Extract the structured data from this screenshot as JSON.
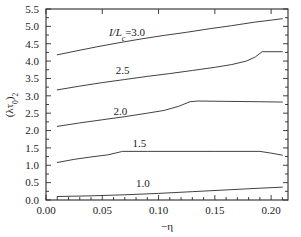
{
  "chart_data": {
    "type": "line",
    "title": "",
    "subtitle": "",
    "xlabel": "−η",
    "ylabel": "(λτ₀)₂",
    "xlim": [
      0.0,
      0.215
    ],
    "ylim": [
      0.0,
      5.5
    ],
    "xticks": [
      0.0,
      0.05,
      0.1,
      0.15,
      0.2
    ],
    "xtick_labels": [
      "0.00",
      "0.05",
      "0.10",
      "0.15",
      "0.20"
    ],
    "x_minor_tick_count": 4,
    "yticks": [
      0.0,
      0.5,
      1.0,
      1.5,
      2.0,
      2.5,
      3.0,
      3.5,
      4.0,
      4.5,
      5.0,
      5.5
    ],
    "ytick_labels": [
      "0.0",
      "0.5",
      "1.0",
      "1.5",
      "2.0",
      "2.5",
      "3.0",
      "3.5",
      "4.0",
      "4.5",
      "5.0",
      "5.5"
    ],
    "grid": false,
    "legend_position": "inline-annotations",
    "line_color": "#2b2b2b",
    "series": [
      {
        "name": "I/Lc=3.0",
        "annotation": "I/Lₑ=3.0",
        "annotation_x": 0.072,
        "annotation_y": 4.73,
        "x": [
          0.01,
          0.025,
          0.045,
          0.065,
          0.085,
          0.105,
          0.125,
          0.145,
          0.165,
          0.185,
          0.2,
          0.21
        ],
        "y": [
          4.18,
          4.28,
          4.41,
          4.53,
          4.64,
          4.74,
          4.83,
          4.93,
          5.02,
          5.12,
          5.18,
          5.22
        ]
      },
      {
        "name": "2.5",
        "annotation": "2.5",
        "annotation_x": 0.068,
        "annotation_y": 3.62,
        "x": [
          0.01,
          0.03,
          0.05,
          0.07,
          0.09,
          0.11,
          0.13,
          0.15,
          0.165,
          0.178,
          0.186,
          0.192,
          0.21
        ],
        "y": [
          3.17,
          3.28,
          3.38,
          3.47,
          3.56,
          3.64,
          3.73,
          3.82,
          3.9,
          4.0,
          4.12,
          4.27,
          4.27
        ]
      },
      {
        "name": "2.0",
        "annotation": "2.0",
        "annotation_x": 0.066,
        "annotation_y": 2.46,
        "x": [
          0.01,
          0.03,
          0.05,
          0.07,
          0.09,
          0.105,
          0.118,
          0.128,
          0.135,
          0.16,
          0.19,
          0.21
        ],
        "y": [
          2.12,
          2.22,
          2.31,
          2.4,
          2.5,
          2.58,
          2.7,
          2.83,
          2.85,
          2.84,
          2.83,
          2.82
        ]
      },
      {
        "name": "1.5",
        "annotation": "1.5",
        "annotation_x": 0.083,
        "annotation_y": 1.52,
        "x": [
          0.01,
          0.025,
          0.04,
          0.055,
          0.068,
          0.09,
          0.12,
          0.15,
          0.175,
          0.19,
          0.2,
          0.21
        ],
        "y": [
          1.08,
          1.17,
          1.24,
          1.3,
          1.4,
          1.4,
          1.4,
          1.4,
          1.4,
          1.4,
          1.35,
          1.29
        ]
      },
      {
        "name": "1.0",
        "annotation": "1.0",
        "annotation_x": 0.086,
        "annotation_y": 0.38,
        "x": [
          0.01,
          0.04,
          0.07,
          0.1,
          0.13,
          0.16,
          0.19,
          0.21
        ],
        "y": [
          0.1,
          0.12,
          0.15,
          0.19,
          0.24,
          0.29,
          0.34,
          0.37
        ]
      }
    ]
  }
}
